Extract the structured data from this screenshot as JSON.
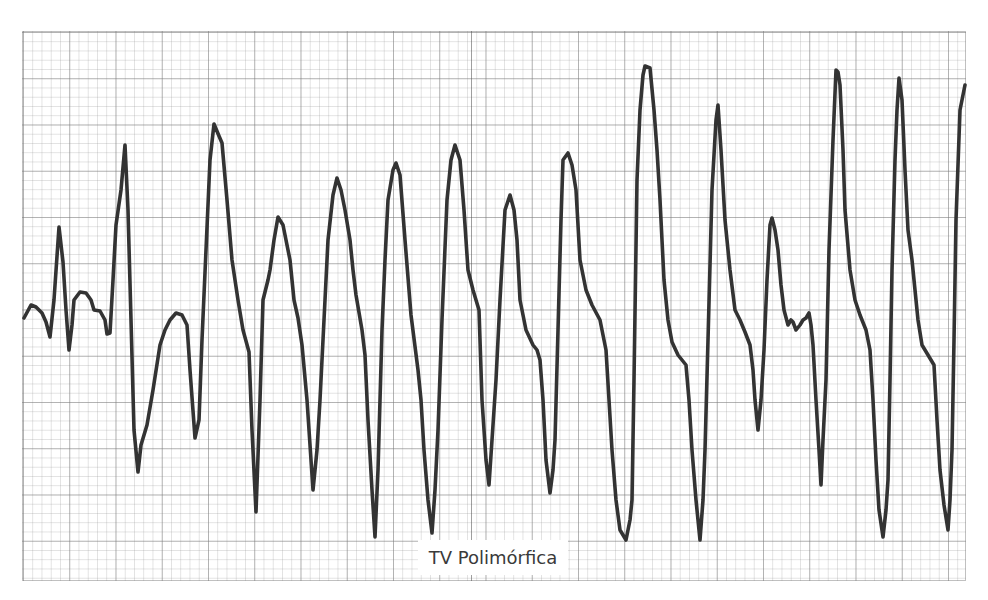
{
  "figure": {
    "caption": "TV Polimórfica",
    "colors": {
      "background": "#ffffff",
      "grid_minor": "#c8c8c8",
      "grid_major": "#a0a0a0",
      "trace": "#333333",
      "caption_text": "#3a3a3a"
    },
    "grid": {
      "left": 22,
      "top": 31,
      "width": 944,
      "height": 550,
      "minor_cell_px": 9.25,
      "major_cell_px": 46.25
    },
    "trace_points": [
      [
        24,
        318
      ],
      [
        31,
        305
      ],
      [
        36,
        307
      ],
      [
        42,
        313
      ],
      [
        46,
        322
      ],
      [
        50,
        337
      ],
      [
        54,
        300
      ],
      [
        59,
        227
      ],
      [
        63,
        262
      ],
      [
        66,
        310
      ],
      [
        69,
        350
      ],
      [
        72,
        325
      ],
      [
        74,
        300
      ],
      [
        80,
        292
      ],
      [
        86,
        293
      ],
      [
        91,
        300
      ],
      [
        94,
        310
      ],
      [
        100,
        311
      ],
      [
        105,
        320
      ],
      [
        107,
        334
      ],
      [
        110,
        333
      ],
      [
        113,
        280
      ],
      [
        116,
        225
      ],
      [
        121,
        190
      ],
      [
        125,
        145
      ],
      [
        128,
        210
      ],
      [
        131,
        320
      ],
      [
        134,
        430
      ],
      [
        138,
        472
      ],
      [
        141,
        445
      ],
      [
        147,
        425
      ],
      [
        153,
        390
      ],
      [
        160,
        345
      ],
      [
        165,
        330
      ],
      [
        170,
        320
      ],
      [
        176,
        313
      ],
      [
        182,
        315
      ],
      [
        187,
        325
      ],
      [
        190,
        370
      ],
      [
        195,
        438
      ],
      [
        199,
        420
      ],
      [
        202,
        340
      ],
      [
        206,
        250
      ],
      [
        210,
        160
      ],
      [
        214,
        124
      ],
      [
        219,
        136
      ],
      [
        222,
        143
      ],
      [
        227,
        200
      ],
      [
        232,
        260
      ],
      [
        238,
        300
      ],
      [
        243,
        330
      ],
      [
        249,
        352
      ],
      [
        252,
        430
      ],
      [
        256,
        512
      ],
      [
        260,
        400
      ],
      [
        263,
        300
      ],
      [
        268,
        280
      ],
      [
        270,
        270
      ],
      [
        274,
        240
      ],
      [
        278,
        217
      ],
      [
        283,
        225
      ],
      [
        290,
        260
      ],
      [
        294,
        300
      ],
      [
        298,
        318
      ],
      [
        302,
        345
      ],
      [
        307,
        400
      ],
      [
        313,
        490
      ],
      [
        317,
        450
      ],
      [
        320,
        400
      ],
      [
        324,
        320
      ],
      [
        328,
        240
      ],
      [
        333,
        195
      ],
      [
        337,
        178
      ],
      [
        341,
        190
      ],
      [
        345,
        210
      ],
      [
        350,
        240
      ],
      [
        353,
        270
      ],
      [
        356,
        295
      ],
      [
        362,
        330
      ],
      [
        365,
        355
      ],
      [
        368,
        420
      ],
      [
        372,
        490
      ],
      [
        375,
        537
      ],
      [
        378,
        470
      ],
      [
        382,
        330
      ],
      [
        385,
        260
      ],
      [
        388,
        200
      ],
      [
        393,
        170
      ],
      [
        396,
        163
      ],
      [
        400,
        175
      ],
      [
        405,
        240
      ],
      [
        411,
        315
      ],
      [
        418,
        370
      ],
      [
        421,
        400
      ],
      [
        424,
        450
      ],
      [
        428,
        500
      ],
      [
        432,
        533
      ],
      [
        435,
        490
      ],
      [
        438,
        430
      ],
      [
        442,
        320
      ],
      [
        447,
        200
      ],
      [
        451,
        160
      ],
      [
        455,
        145
      ],
      [
        460,
        160
      ],
      [
        464,
        210
      ],
      [
        468,
        270
      ],
      [
        473,
        290
      ],
      [
        479,
        310
      ],
      [
        482,
        400
      ],
      [
        486,
        460
      ],
      [
        489,
        485
      ],
      [
        492,
        440
      ],
      [
        496,
        380
      ],
      [
        500,
        300
      ],
      [
        505,
        210
      ],
      [
        510,
        195
      ],
      [
        514,
        210
      ],
      [
        517,
        240
      ],
      [
        520,
        300
      ],
      [
        526,
        330
      ],
      [
        533,
        345
      ],
      [
        537,
        350
      ],
      [
        540,
        360
      ],
      [
        543,
        400
      ],
      [
        546,
        460
      ],
      [
        550,
        493
      ],
      [
        553,
        470
      ],
      [
        555,
        440
      ],
      [
        558,
        330
      ],
      [
        561,
        220
      ],
      [
        563,
        160
      ],
      [
        568,
        153
      ],
      [
        572,
        165
      ],
      [
        576,
        190
      ],
      [
        580,
        260
      ],
      [
        586,
        290
      ],
      [
        592,
        305
      ],
      [
        600,
        320
      ],
      [
        606,
        350
      ],
      [
        609,
        400
      ],
      [
        612,
        450
      ],
      [
        616,
        500
      ],
      [
        620,
        530
      ],
      [
        626,
        540
      ],
      [
        630,
        520
      ],
      [
        632,
        500
      ],
      [
        634,
        380
      ],
      [
        637,
        180
      ],
      [
        640,
        110
      ],
      [
        643,
        75
      ],
      [
        645,
        66
      ],
      [
        650,
        68
      ],
      [
        654,
        110
      ],
      [
        657,
        150
      ],
      [
        660,
        200
      ],
      [
        664,
        280
      ],
      [
        668,
        320
      ],
      [
        672,
        342
      ],
      [
        678,
        355
      ],
      [
        686,
        365
      ],
      [
        689,
        400
      ],
      [
        692,
        450
      ],
      [
        696,
        500
      ],
      [
        700,
        540
      ],
      [
        703,
        500
      ],
      [
        705,
        450
      ],
      [
        708,
        340
      ],
      [
        712,
        190
      ],
      [
        716,
        120
      ],
      [
        718,
        105
      ],
      [
        721,
        150
      ],
      [
        725,
        220
      ],
      [
        730,
        270
      ],
      [
        735,
        310
      ],
      [
        740,
        320
      ],
      [
        745,
        332
      ],
      [
        750,
        345
      ],
      [
        753,
        370
      ],
      [
        755,
        400
      ],
      [
        758,
        430
      ],
      [
        761,
        400
      ],
      [
        764,
        350
      ],
      [
        767,
        280
      ],
      [
        770,
        225
      ],
      [
        772,
        218
      ],
      [
        775,
        230
      ],
      [
        778,
        250
      ],
      [
        781,
        285
      ],
      [
        784,
        310
      ],
      [
        788,
        325
      ],
      [
        791,
        320
      ],
      [
        793,
        322
      ],
      [
        796,
        330
      ],
      [
        800,
        325
      ],
      [
        803,
        320
      ],
      [
        806,
        318
      ],
      [
        809,
        313
      ],
      [
        811,
        325
      ],
      [
        813,
        345
      ],
      [
        816,
        400
      ],
      [
        819,
        450
      ],
      [
        821,
        485
      ],
      [
        823,
        440
      ],
      [
        826,
        380
      ],
      [
        829,
        250
      ],
      [
        833,
        140
      ],
      [
        836,
        70
      ],
      [
        838,
        72
      ],
      [
        840,
        85
      ],
      [
        843,
        150
      ],
      [
        845,
        210
      ],
      [
        850,
        270
      ],
      [
        855,
        300
      ],
      [
        860,
        315
      ],
      [
        866,
        330
      ],
      [
        870,
        350
      ],
      [
        873,
        400
      ],
      [
        876,
        460
      ],
      [
        879,
        510
      ],
      [
        883,
        537
      ],
      [
        886,
        510
      ],
      [
        888,
        480
      ],
      [
        890,
        380
      ],
      [
        892,
        270
      ],
      [
        895,
        160
      ],
      [
        897,
        110
      ],
      [
        899,
        78
      ],
      [
        902,
        100
      ],
      [
        905,
        170
      ],
      [
        908,
        230
      ],
      [
        912,
        260
      ],
      [
        915,
        290
      ],
      [
        918,
        320
      ],
      [
        922,
        345
      ],
      [
        928,
        355
      ],
      [
        934,
        365
      ],
      [
        937,
        420
      ],
      [
        940,
        470
      ],
      [
        944,
        505
      ],
      [
        948,
        530
      ],
      [
        950,
        500
      ],
      [
        952,
        450
      ],
      [
        954,
        340
      ],
      [
        956,
        220
      ],
      [
        960,
        110
      ],
      [
        965,
        85
      ]
    ]
  }
}
